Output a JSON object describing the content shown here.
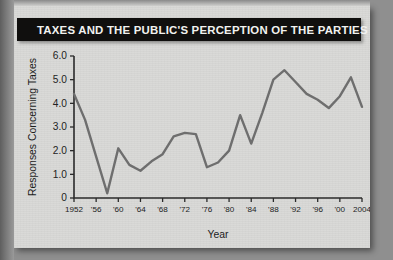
{
  "banner": {
    "title": "TAXES AND THE PUBLIC'S PERCEPTION OF THE PARTIES"
  },
  "chart_data": {
    "type": "line",
    "title": "TAXES AND THE PUBLIC'S PERCEPTION OF THE PARTIES",
    "xlabel": "Year",
    "ylabel": "Responses Concerning Taxes",
    "xlim": [
      1952,
      2004
    ],
    "ylim": [
      0,
      6.0
    ],
    "grid": false,
    "legend": null,
    "y_ticks": [
      0,
      1.0,
      2.0,
      3.0,
      4.0,
      5.0,
      6.0
    ],
    "y_tick_labels": [
      "0",
      "1.0",
      "2.0",
      "3.0",
      "4.0",
      "5.0",
      "6.0"
    ],
    "x_ticks": [
      1952,
      1956,
      1960,
      1964,
      1968,
      1972,
      1976,
      1980,
      1984,
      1988,
      1992,
      1996,
      2000,
      2004
    ],
    "x_tick_labels": [
      "1952",
      "'56",
      "'60",
      "'64",
      "'68",
      "'72",
      "'76",
      "'80",
      "'84",
      "'88",
      "'92",
      "'96",
      "'00",
      "2004"
    ],
    "x": [
      1952,
      1954,
      1956,
      1958,
      1960,
      1962,
      1964,
      1966,
      1968,
      1970,
      1972,
      1974,
      1976,
      1978,
      1980,
      1982,
      1984,
      1986,
      1988,
      1990,
      1992,
      1994,
      1996,
      1998,
      2000,
      2002,
      2004
    ],
    "values": [
      4.4,
      3.3,
      1.75,
      0.2,
      2.1,
      1.4,
      1.15,
      1.55,
      1.85,
      2.6,
      2.75,
      2.7,
      1.3,
      1.5,
      2.0,
      3.5,
      2.3,
      3.6,
      5.0,
      5.4,
      4.9,
      4.4,
      4.15,
      3.8,
      4.3,
      5.1,
      3.85
    ],
    "series": [
      {
        "name": "Responses Concerning Taxes",
        "color": "#6e6e6e",
        "values": [
          4.4,
          3.3,
          1.75,
          0.2,
          2.1,
          1.4,
          1.15,
          1.55,
          1.85,
          2.6,
          2.75,
          2.7,
          1.3,
          1.5,
          2.0,
          3.5,
          2.3,
          3.6,
          5.0,
          5.4,
          4.9,
          4.4,
          4.15,
          3.8,
          4.3,
          5.1,
          3.85
        ]
      }
    ]
  }
}
